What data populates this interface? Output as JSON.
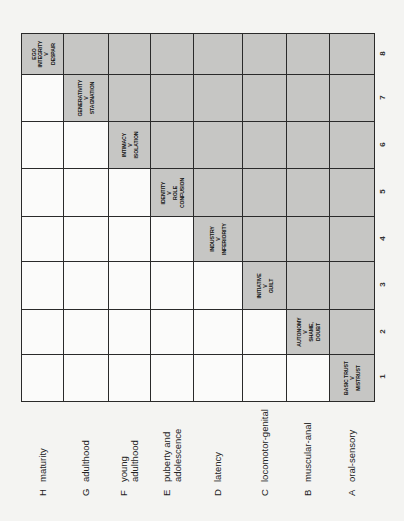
{
  "diagram": {
    "title": "",
    "orientation": "rotated 90deg counter-clockwise (text reads bottom-to-top)",
    "colors": {
      "shaded": "#c6c6c4",
      "unshaded": "#fbfbfa",
      "grid_line": "#2a2a2a",
      "background": "#f4f4f2"
    },
    "stages": [
      {
        "letter": "H",
        "label": "maturity",
        "label_lines": [
          "maturity"
        ]
      },
      {
        "letter": "G",
        "label": "adulthood",
        "label_lines": [
          "adulthood"
        ]
      },
      {
        "letter": "F",
        "label": "young adulthood",
        "label_lines": [
          "young",
          "adulthood"
        ]
      },
      {
        "letter": "E",
        "label": "puberty and adolescence",
        "label_lines": [
          "puberty and",
          "adolescence"
        ]
      },
      {
        "letter": "D",
        "label": "latency",
        "label_lines": [
          "latency"
        ]
      },
      {
        "letter": "C",
        "label": "locomotor-genital",
        "label_lines": [
          "locomotor-genital"
        ]
      },
      {
        "letter": "B",
        "label": "muscular-anal",
        "label_lines": [
          "muscular-anal"
        ]
      },
      {
        "letter": "A",
        "label": "oral-sensory",
        "label_lines": [
          "oral-sensory"
        ]
      }
    ],
    "columns": [
      "8",
      "7",
      "6",
      "5",
      "4",
      "3",
      "2",
      "1"
    ],
    "crises": [
      {
        "stage": "H",
        "column": "8",
        "lines": [
          "EGO",
          "INTEGRITY",
          "V",
          "DESPAIR"
        ]
      },
      {
        "stage": "G",
        "column": "7",
        "lines": [
          "GENERATIVITY",
          "V",
          "STAGNATION"
        ]
      },
      {
        "stage": "F",
        "column": "6",
        "lines": [
          "INTIMACY",
          "V",
          "ISOLATION"
        ]
      },
      {
        "stage": "E",
        "column": "5",
        "lines": [
          "IDENTITY",
          "V",
          "ROLE",
          "CONFUSION"
        ]
      },
      {
        "stage": "D",
        "column": "4",
        "lines": [
          "INDUSTRY",
          "V",
          "INFERIORITY"
        ]
      },
      {
        "stage": "C",
        "column": "3",
        "lines": [
          "INITIATIVE",
          "V",
          "GUILT"
        ]
      },
      {
        "stage": "B",
        "column": "2",
        "lines": [
          "AUTONOMY",
          "V",
          "SHAME,",
          "DOUBT"
        ]
      },
      {
        "stage": "A",
        "column": "1",
        "lines": [
          "BASIC TRUST",
          "V",
          "MISTRUST"
        ]
      }
    ]
  }
}
